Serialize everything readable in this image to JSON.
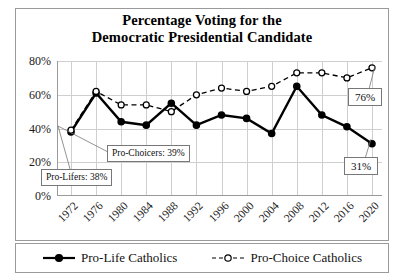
{
  "chart_data": {
    "type": "line",
    "title": "Percentage Voting for the Democratic Presidential Candidate",
    "title_line1": "Percentage Voting for the",
    "title_line2": "Democratic Presidential Candidate",
    "xlabel": "",
    "ylabel": "",
    "grid": true,
    "legend_position": "bottom",
    "ylim": [
      0,
      80
    ],
    "yticks": [
      "0%",
      "20%",
      "40%",
      "60%",
      "80%"
    ],
    "ytick_values": [
      0,
      20,
      40,
      60,
      80
    ],
    "categories": [
      "1972",
      "1976",
      "1980",
      "1984",
      "1988",
      "1992",
      "1996",
      "2000",
      "2004",
      "2008",
      "2012",
      "2016",
      "2020"
    ],
    "series": [
      {
        "name": "Pro-Life Catholics",
        "marker": "filled-circle",
        "line": "solid",
        "color": "#000000",
        "values": [
          38,
          61,
          44,
          42,
          55,
          42,
          48,
          46,
          37,
          65,
          48,
          41,
          31
        ]
      },
      {
        "name": "Pro-Choice Catholics",
        "marker": "open-circle",
        "line": "dashed",
        "color": "#000000",
        "values": [
          39,
          62,
          54,
          54,
          50,
          60,
          64,
          62,
          65,
          73,
          73,
          70,
          76
        ]
      }
    ],
    "annotations": [
      {
        "id": "pro-choicers-callout",
        "text": "Pro-Choicers: 39%"
      },
      {
        "id": "pro-lifers-callout",
        "text": "Pro-Lifers: 38%"
      },
      {
        "id": "pro-choice-end-value",
        "text": "76%"
      },
      {
        "id": "pro-life-end-value",
        "text": "31%"
      }
    ]
  },
  "legend": {
    "items": [
      {
        "label": "Pro-Life Catholics",
        "marker": "filled-circle",
        "line": "solid"
      },
      {
        "label": "Pro-Choice Catholics",
        "marker": "open-circle",
        "line": "dashed"
      }
    ]
  }
}
